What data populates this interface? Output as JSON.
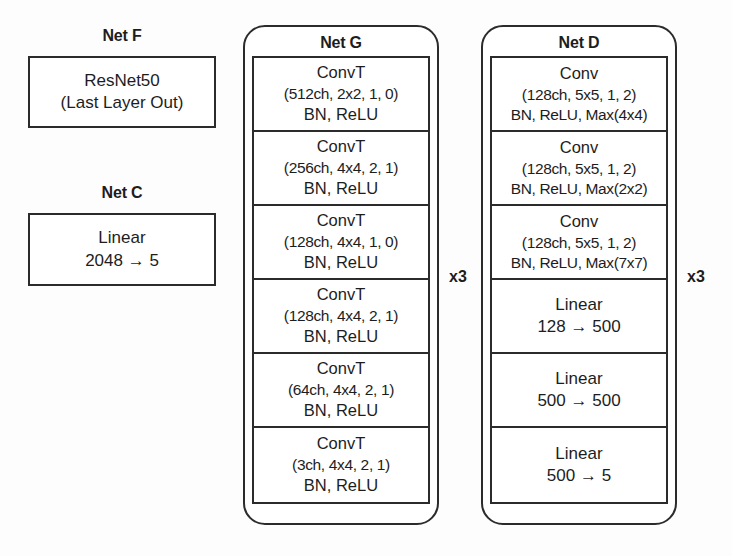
{
  "figure": {
    "background_color": "#fdfdfd",
    "line_color": "#2b2b2b"
  },
  "net_f": {
    "label": "Net F",
    "box": {
      "line1": "ResNet50",
      "line2": "(Last Layer Out)"
    }
  },
  "net_c": {
    "label": "Net C",
    "box": {
      "line1": "Linear",
      "line2": "2048 → 5"
    }
  },
  "net_g": {
    "label": "Net G",
    "repeat_marker": "x3",
    "blocks": [
      {
        "line1": "ConvT",
        "line2": "(512ch, 2x2, 1, 0)",
        "line3": "BN, ReLU"
      },
      {
        "line1": "ConvT",
        "line2": "(256ch, 4x4, 2, 1)",
        "line3": "BN, ReLU"
      },
      {
        "line1": "ConvT",
        "line2": "(128ch, 4x4, 1, 0)",
        "line3": "BN, ReLU"
      },
      {
        "line1": "ConvT",
        "line2": "(128ch, 4x4, 2, 1)",
        "line3": "BN, ReLU"
      },
      {
        "line1": "ConvT",
        "line2": "(64ch, 4x4, 2, 1)",
        "line3": "BN, ReLU"
      },
      {
        "line1": "ConvT",
        "line2": "(3ch, 4x4, 2, 1)",
        "line3": "BN, ReLU"
      }
    ]
  },
  "net_d": {
    "label": "Net D",
    "repeat_marker": "x3",
    "blocks": [
      {
        "line1": "Conv",
        "line2": "(128ch, 5x5, 1, 2)",
        "line3": "BN, ReLU, Max(4x4)"
      },
      {
        "line1": "Conv",
        "line2": "(128ch, 5x5, 1, 2)",
        "line3": "BN, ReLU, Max(2x2)"
      },
      {
        "line1": "Conv",
        "line2": "(128ch, 5x5, 1, 2)",
        "line3": "BN, ReLU, Max(7x7)"
      },
      {
        "line1": "Linear",
        "line2": "128 → 500",
        "line3": ""
      },
      {
        "line1": "Linear",
        "line2": "500 → 500",
        "line3": ""
      },
      {
        "line1": "Linear",
        "line2": "500 → 5",
        "line3": ""
      }
    ]
  }
}
